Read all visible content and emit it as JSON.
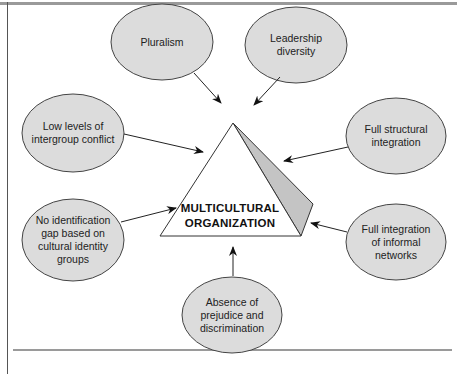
{
  "diagram": {
    "center": {
      "line1": "MULTICULTURAL",
      "line2": "ORGANIZATION"
    },
    "nodes": [
      {
        "id": "pluralism",
        "label": "Pluralism",
        "cx": 162,
        "cy": 42,
        "rx": 51,
        "ry": 38
      },
      {
        "id": "leadership-diversity",
        "label": "Leadership diversity",
        "cx": 296,
        "cy": 45,
        "rx": 51,
        "ry": 38
      },
      {
        "id": "low-conflict",
        "label": "Low levels of intergroup conflict",
        "cx": 73,
        "cy": 133,
        "rx": 51,
        "ry": 39
      },
      {
        "id": "structural-integration",
        "label": "Full structural integration",
        "cx": 396,
        "cy": 136,
        "rx": 50,
        "ry": 38
      },
      {
        "id": "identification-gap",
        "label": "No identification gap based on cultural identity groups",
        "cx": 73,
        "cy": 240,
        "rx": 51,
        "ry": 41
      },
      {
        "id": "informal-networks",
        "label": "Full integration of informal networks",
        "cx": 396,
        "cy": 242,
        "rx": 50,
        "ry": 38
      },
      {
        "id": "no-prejudice",
        "label": "Absence of prejudice and discrimination",
        "cx": 232,
        "cy": 315,
        "rx": 50,
        "ry": 38
      }
    ],
    "colors": {
      "node_fill": "#dcdcdc",
      "node_stroke": "#444444",
      "shade_fill": "#c4c4c4",
      "rule": "#9a9a9a"
    }
  }
}
